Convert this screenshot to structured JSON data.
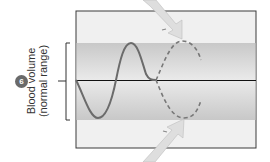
{
  "figure": {
    "step_badge": "6",
    "y_label_line1": "Blood volume",
    "y_label_line2": "(normal range)",
    "colors": {
      "frame_stroke": "#3a3a3a",
      "background_panel": "#eeeeee",
      "normal_band": "#cfcfcf",
      "solid_curve": "#6b6b6b",
      "dashed_curve": "#777777",
      "setpoint_line": "#111111",
      "arrow_fill": "#dcdcdc"
    },
    "elements": {
      "solid_curve": "oscillation of blood volume around set point",
      "dashed_curve": "projected oscillation",
      "top_arrow": "incoming regulation arrow from above",
      "bottom_arrow": "incoming regulation arrow from below"
    }
  }
}
